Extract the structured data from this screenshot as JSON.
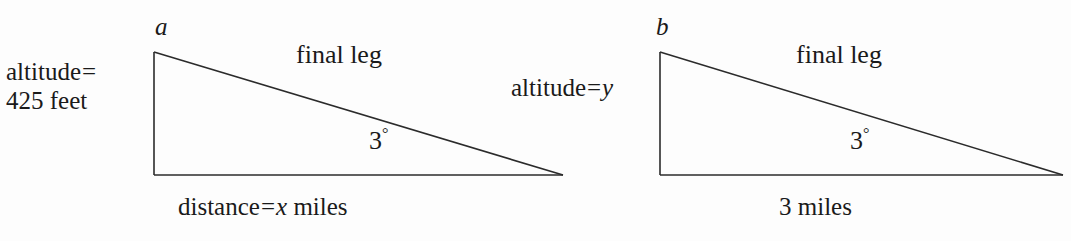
{
  "figure": {
    "background_color": "#fdfdfd",
    "line_color": "#2b2b2b",
    "text_color": "#1a1a1a"
  },
  "triangles": [
    {
      "id": "a",
      "vertex_label": "a",
      "altitude_label": {
        "line1_text": "altitude",
        "equals": "=",
        "line1_value": "",
        "line2": "425 feet",
        "full": "altitude = 425 feet"
      },
      "hypotenuse_label": "final leg",
      "angle_value": "3",
      "angle_symbol": "°",
      "angle_full": "3°",
      "base_label": {
        "prefix": "distance",
        "equals": "=",
        "variable": "x",
        "suffix": " miles",
        "full": "distance = x miles"
      },
      "geometry": {
        "top_left": [
          154,
          52
        ],
        "bottom_left": [
          154,
          175
        ],
        "bottom_right": [
          563,
          175
        ]
      }
    },
    {
      "id": "b",
      "vertex_label": "b",
      "altitude_label": {
        "prefix": "altitude",
        "equals": "=",
        "variable": "y",
        "full": "altitude = y"
      },
      "hypotenuse_label": "final leg",
      "angle_value": "3",
      "angle_symbol": "°",
      "angle_full": "3°",
      "base_label": {
        "full": "3 miles"
      },
      "geometry": {
        "top_left": [
          660,
          52
        ],
        "bottom_left": [
          660,
          175
        ],
        "bottom_right": [
          1063,
          175
        ]
      }
    }
  ]
}
